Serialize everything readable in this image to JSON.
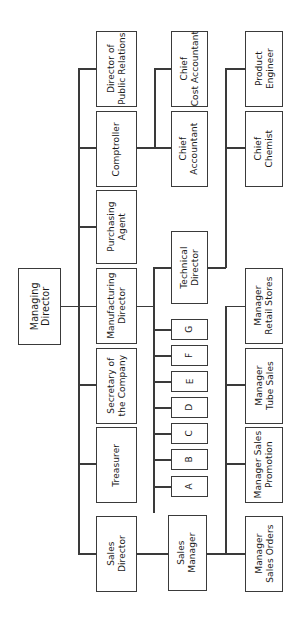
{
  "diagram": {
    "orientation": "rotated-90",
    "line_color": "#3a3a3a",
    "box_border_color": "#3a3a3a",
    "background_color": "#ffffff"
  },
  "nodes": {
    "managing_director": "Managing\nDirector",
    "director_public_relations": "Director of\nPublic Relations",
    "comptroller": "Comptroller",
    "purchasing_agent": "Purchasing\nAgent",
    "manufacturing_director": "Manufacturing\nDirector",
    "secretary_of_company": "Secretary of\nthe Company",
    "treasurer": "Treasurer",
    "sales_director": "Sales\nDirector",
    "chief_cost_accountant": "Chief\nCost Accountant",
    "chief_accountant": "Chief\nAccountant",
    "technical_director": "Technical\nDirector",
    "sales_manager": "Sales\nManager",
    "product_engineer": "Product\nEngineer",
    "chief_chemist": "Chief\nChemist",
    "manager_retail_stores": "Manager\nRetail Stores",
    "manager_tube_sales": "Manager\nTube Sales",
    "manager_sales_promotion": "Manager Sales\nPromotion",
    "manager_sales_orders": "Manager\nSales Orders",
    "unit_a": "A",
    "unit_b": "B",
    "unit_c": "C",
    "unit_d": "D",
    "unit_e": "E",
    "unit_f": "F",
    "unit_g": "G"
  }
}
